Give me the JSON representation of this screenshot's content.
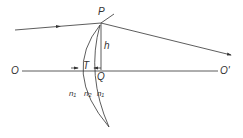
{
  "labels": {
    "P": "P",
    "h": "h",
    "O": "O",
    "O_prime": "O'",
    "T": "T",
    "Q": "Q",
    "n1_left": "n₁",
    "n2": "n₂",
    "n1_right": "n₁"
  },
  "colors": {
    "line": "#333333"
  }
}
